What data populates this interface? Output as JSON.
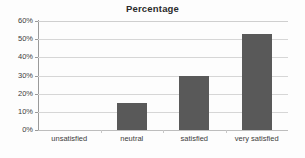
{
  "chart_data": {
    "type": "bar",
    "title": "Percentage",
    "xlabel": "",
    "ylabel": "",
    "categories": [
      "unsatisfied",
      "neutral",
      "satisfied",
      "very satisfied"
    ],
    "values": [
      0,
      15,
      29.5,
      53
    ],
    "ylim": [
      0,
      60
    ],
    "ytick_labels": [
      "0%",
      "10%",
      "20%",
      "30%",
      "40%",
      "50%",
      "60%"
    ],
    "ytick_values": [
      0,
      10,
      20,
      30,
      40,
      50,
      60
    ],
    "grid": true,
    "legend": false,
    "legend_position": "none",
    "bar_color": "#595959",
    "gridline_color": "#d6d6d6",
    "axis_color": "#9a9a9a",
    "background_color": "#fdfdfd",
    "title_color": "#2b2b2b",
    "tick_label_color": "#3c3c3c"
  }
}
